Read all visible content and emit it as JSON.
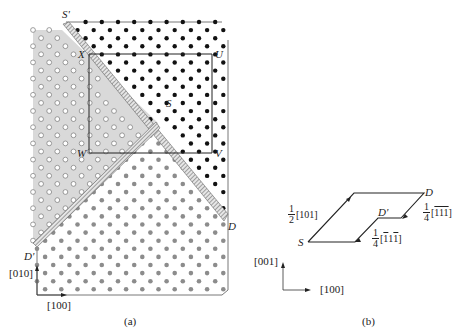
{
  "figure": {
    "panel_a": {
      "caption": "(a)",
      "point_labels": {
        "S_prime": "S'",
        "X": "X",
        "U": "U",
        "S": "S",
        "W": "W",
        "V": "V",
        "D": "D",
        "D_prime": "D'"
      },
      "axes": {
        "vertical": "[010]",
        "horizontal": "[100]"
      },
      "regions": [
        {
          "name": "white-atoms-shaded-region",
          "fill": "#d9d9d9",
          "atom": "open-circle"
        },
        {
          "name": "black-atoms-region",
          "fill": "#ffffff",
          "atom": "black-dot"
        },
        {
          "name": "gray-atoms-region",
          "fill": "#ffffff",
          "atom": "gray-dot"
        },
        {
          "name": "antiphase-boundary-band",
          "fill": "#bdbdbd",
          "atom": "hatched"
        }
      ],
      "colors": {
        "shade": "#d9d9d9",
        "black_atom": "#111111",
        "gray_atom": "#8c8c8c",
        "open_atom": "#ffffff",
        "line": "#333333"
      }
    },
    "panel_b": {
      "caption": "(b)",
      "point_labels": {
        "S": "S",
        "D": "D",
        "D_prime": "D'"
      },
      "vectors": [
        {
          "coef_num": "1",
          "coef_den": "2",
          "dir": "[101]"
        },
        {
          "coef_num": "1",
          "coef_den": "4",
          "dir_open": "[",
          "dir_body": "111",
          "dir_close": "]",
          "bars": "all"
        },
        {
          "coef_num": "1",
          "coef_den": "4",
          "dir_open": "[",
          "dir_body": "11",
          "dir_close": "]",
          "bars": "first-and-last"
        }
      ],
      "axes": {
        "vertical": "[001]",
        "horizontal": "[100]"
      }
    }
  }
}
